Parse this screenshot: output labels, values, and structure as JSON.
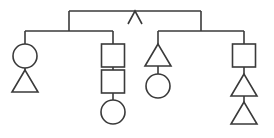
{
  "canvas": {
    "width": 274,
    "height": 138,
    "background_color": "#ffffff",
    "line_color": "#3a3a3a",
    "line_width": 1.6,
    "shape_fill": "none"
  },
  "diagram": {
    "type": "pedigree-chart",
    "title": "",
    "legend": {
      "circle_meaning": "female",
      "square_meaning": "male",
      "triangle_meaning": "pregnancy-or-unknown-sex",
      "caret_meaning": "generation-apex-marker"
    },
    "top_bar": {
      "name": "top-sibship-bar",
      "x1": 69,
      "x2": 201,
      "y": 11,
      "left_drop_to_y": 31,
      "right_drop_to_y": 31
    },
    "caret_marker": {
      "name": "caret-marker",
      "apex_x": 135,
      "apex_y": 11,
      "left_x": 128,
      "right_x": 142,
      "bottom_y": 24
    },
    "sibship_bars": [
      {
        "name": "left-sibship-bar",
        "x1": 25,
        "x2": 113,
        "y": 31
      },
      {
        "name": "right-sibship-bar",
        "x1": 158,
        "x2": 244,
        "y": 31
      }
    ],
    "branches": [
      {
        "id": "branch-1",
        "name": "branch-leftmost",
        "center_x": 25,
        "connector_from_y": 31,
        "connector_to_y": 44,
        "nodes": [
          {
            "id": "n1",
            "name": "node-circle-female",
            "shape": "circle",
            "cx": 25,
            "cy": 56,
            "r": 12,
            "label": ""
          },
          {
            "id": "n2",
            "name": "node-triangle",
            "shape": "triangle",
            "cx": 25,
            "top_y": 70,
            "bottom_y": 92,
            "half_width": 13,
            "label": ""
          }
        ],
        "connectors": [
          {
            "name": "connector-n1-n2",
            "x": 25,
            "y1": 68,
            "y2": 70
          }
        ]
      },
      {
        "id": "branch-2",
        "name": "branch-second-squares",
        "center_x": 113,
        "connector_from_y": 31,
        "connector_to_y": 44,
        "nodes": [
          {
            "id": "n3",
            "name": "node-square-male",
            "shape": "square",
            "cx": 113,
            "top_y": 44,
            "size": 23,
            "label": ""
          },
          {
            "id": "n4",
            "name": "node-square-male",
            "shape": "square",
            "cx": 113,
            "top_y": 70,
            "size": 23,
            "label": ""
          },
          {
            "id": "n5",
            "name": "node-circle-female",
            "shape": "circle",
            "cx": 113,
            "cy": 112,
            "r": 12,
            "label": ""
          }
        ],
        "connectors": [
          {
            "name": "connector-n3-n4",
            "x": 113,
            "y1": 67,
            "y2": 70
          },
          {
            "name": "connector-n4-n5",
            "x": 113,
            "y1": 93,
            "y2": 100
          }
        ]
      },
      {
        "id": "branch-3",
        "name": "branch-third-triangle",
        "center_x": 158,
        "connector_from_y": 31,
        "connector_to_y": 44,
        "nodes": [
          {
            "id": "n6",
            "name": "node-triangle",
            "shape": "triangle",
            "cx": 158,
            "top_y": 44,
            "bottom_y": 66,
            "half_width": 13,
            "label": ""
          },
          {
            "id": "n7",
            "name": "node-circle-female",
            "shape": "circle",
            "cx": 158,
            "cy": 86,
            "r": 12,
            "label": ""
          }
        ],
        "connectors": [
          {
            "name": "connector-n6-n7",
            "x": 158,
            "y1": 66,
            "y2": 74
          }
        ]
      },
      {
        "id": "branch-4",
        "name": "branch-rightmost",
        "center_x": 244,
        "connector_from_y": 31,
        "connector_to_y": 44,
        "nodes": [
          {
            "id": "n8",
            "name": "node-square-male",
            "shape": "square",
            "cx": 244,
            "top_y": 44,
            "size": 23,
            "label": ""
          },
          {
            "id": "n9",
            "name": "node-triangle",
            "shape": "triangle",
            "cx": 244,
            "top_y": 74,
            "bottom_y": 96,
            "half_width": 13,
            "label": ""
          },
          {
            "id": "n10",
            "name": "node-triangle",
            "shape": "triangle",
            "cx": 244,
            "top_y": 102,
            "bottom_y": 124,
            "half_width": 13,
            "label": ""
          }
        ],
        "connectors": [
          {
            "name": "connector-n8-n9",
            "x": 244,
            "y1": 67,
            "y2": 74
          },
          {
            "name": "connector-n9-n10",
            "x": 244,
            "y1": 96,
            "y2": 102
          }
        ]
      }
    ]
  }
}
